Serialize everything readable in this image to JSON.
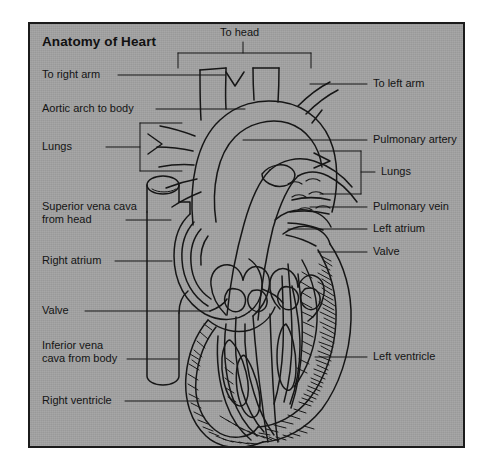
{
  "figure": {
    "title": "Anatomy of Heart",
    "background_color": "#a2a2a2",
    "page_color": "#ffffff",
    "ink_color": "#141414",
    "border_color": "#1b1b1b"
  },
  "labels": {
    "top_center": {
      "text": "To head",
      "leader": "bracket-down"
    },
    "left": [
      {
        "text": "To right arm",
        "leader": "line"
      },
      {
        "text": "Aortic arch to body",
        "leader": "line"
      },
      {
        "text": "Lungs",
        "leader": "bracket-right"
      },
      {
        "text": "Superior vena cava\nfrom head",
        "leader": "line"
      },
      {
        "text": "Right atrium",
        "leader": "line"
      },
      {
        "text": "Valve",
        "leader": "line"
      },
      {
        "text": "Inferior vena\ncava from body",
        "leader": "line"
      },
      {
        "text": "Right ventricle",
        "leader": "line"
      }
    ],
    "right": [
      {
        "text": "To left arm",
        "leader": "line"
      },
      {
        "text": "Pulmonary artery",
        "leader": "line"
      },
      {
        "text": "Lungs",
        "leader": "bracket-left"
      },
      {
        "text": "Pulmonary vein",
        "leader": "line"
      },
      {
        "text": "Left atrium",
        "leader": "line"
      },
      {
        "text": "Valve",
        "leader": "line"
      },
      {
        "text": "Left ventricle",
        "leader": "line"
      }
    ]
  },
  "label_lines": {
    "left_0": "To right arm",
    "left_1": "Aortic arch to body",
    "left_2": "Lungs",
    "left_3a": "Superior vena cava",
    "left_3b": "from head",
    "left_4": "Right atrium",
    "left_5": "Valve",
    "left_6a": "Inferior vena",
    "left_6b": "cava from body",
    "left_7": "Right ventricle",
    "right_0": "To left arm",
    "right_1": "Pulmonary artery",
    "right_2": "Lungs",
    "right_3": "Pulmonary vein",
    "right_4": "Left atrium",
    "right_5": "Valve",
    "right_6": "Left ventricle",
    "top": "To head"
  }
}
